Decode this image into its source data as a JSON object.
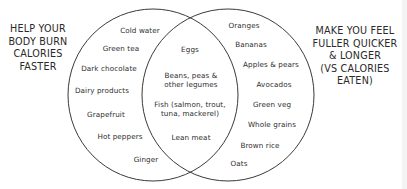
{
  "diagram": {
    "type": "venn",
    "left_set": {
      "title": "HELP YOUR\nBODY BURN\nCALORIES\nFASTER",
      "items": [
        "Cold water",
        "Green tea",
        "Dark chocolate",
        "Dairy products",
        "Grapefruit",
        "Hot peppers",
        "Ginger"
      ]
    },
    "right_set": {
      "title": "MAKE YOU FEEL\nFULLER QUICKER\n& LONGER\n(VS CALORIES\nEATEN)",
      "items": [
        "Oranges",
        "Bananas",
        "Apples & pears",
        "Avocados",
        "Green veg",
        "Whole grains",
        "Brown rice",
        "Oats"
      ]
    },
    "intersection": {
      "items": [
        "Eggs",
        "Beans, peas &\nother legumes",
        "Fish (salmon, trout,\ntuna, mackerel)",
        "Lean meat"
      ]
    },
    "colors": {
      "outline": "#3a3a3a",
      "text": "#2e2e2e",
      "background": "#ffffff"
    }
  }
}
